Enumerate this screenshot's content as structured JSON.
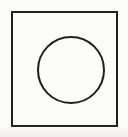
{
  "figure": {
    "title": "Square with inscribed circle",
    "canvas": {
      "width": 128,
      "height": 137,
      "background_color": "#fbfbfa",
      "paper_tint_color": "#eceae7"
    },
    "shapes": [
      {
        "id": "square",
        "name": "square-outline",
        "kind": "rectangle",
        "label": "Square",
        "x": 12,
        "y": 12,
        "width": 105,
        "height": 114,
        "stroke_color": "#1f1f1f",
        "stroke_width": 2,
        "fill": "none"
      },
      {
        "id": "circle",
        "name": "circle-outline",
        "kind": "circle",
        "label": "Circle",
        "center_x": 71,
        "center_y": 70,
        "radius": 33,
        "stroke_color": "#1f1f1f",
        "stroke_width": 2,
        "fill": "none"
      }
    ]
  }
}
